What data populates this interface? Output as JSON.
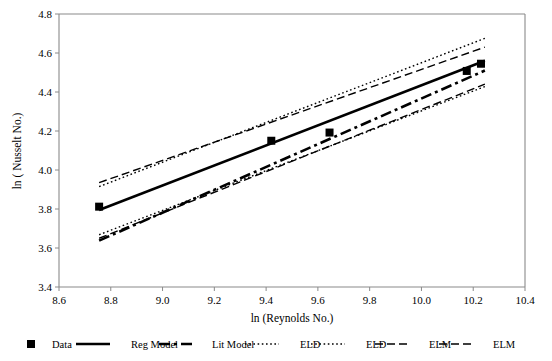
{
  "chart_data": {
    "type": "line",
    "title": "",
    "xlabel": "ln (Reynolds No.)",
    "ylabel": "ln ( Nusselt No.)",
    "xlim": [
      8.6,
      10.4
    ],
    "ylim": [
      3.4,
      4.8
    ],
    "xticks": [
      "8.6",
      "8.8",
      "9.0",
      "9.2",
      "9.4",
      "9.6",
      "9.8",
      "10.0",
      "10.2",
      "10.4"
    ],
    "yticks": [
      "3.4",
      "3.6",
      "3.8",
      "4.0",
      "4.2",
      "4.4",
      "4.6",
      "4.8"
    ],
    "grid": false,
    "legend_position": "bottom",
    "series": [
      {
        "name": "Data",
        "style": "marker",
        "marker": "square",
        "points": [
          {
            "x": 8.755,
            "y": 3.812
          },
          {
            "x": 9.42,
            "y": 4.15
          },
          {
            "x": 9.645,
            "y": 4.192
          },
          {
            "x": 10.175,
            "y": 4.508
          },
          {
            "x": 10.23,
            "y": 4.545
          }
        ]
      },
      {
        "name": "Reg Model",
        "style": "solid-thick",
        "points": [
          {
            "x": 8.755,
            "y": 3.795
          },
          {
            "x": 10.245,
            "y": 4.56
          }
        ]
      },
      {
        "name": "Lit Model",
        "style": "dash-dot-thick",
        "points": [
          {
            "x": 8.755,
            "y": 3.638
          },
          {
            "x": 10.245,
            "y": 4.51
          }
        ]
      },
      {
        "name": "ELD",
        "style": "dotted",
        "points": [
          {
            "x": 8.755,
            "y": 3.915
          },
          {
            "x": 10.245,
            "y": 4.675
          }
        ]
      },
      {
        "name": "ELD",
        "style": "dotted",
        "points": [
          {
            "x": 8.755,
            "y": 3.668
          },
          {
            "x": 10.245,
            "y": 4.428
          }
        ]
      },
      {
        "name": "ELM",
        "style": "dashed",
        "points": [
          {
            "x": 8.755,
            "y": 3.935
          },
          {
            "x": 10.245,
            "y": 4.63
          }
        ]
      },
      {
        "name": "ELM",
        "style": "dashed",
        "points": [
          {
            "x": 8.755,
            "y": 3.65
          },
          {
            "x": 10.245,
            "y": 4.44
          }
        ]
      }
    ],
    "legend": [
      {
        "label": "Data",
        "style": "marker"
      },
      {
        "label": "Reg Model",
        "style": "solid-thick"
      },
      {
        "label": "Lit Model",
        "style": "dash-dot-thick"
      },
      {
        "label": "ELD",
        "style": "dotted"
      },
      {
        "label": "ELD",
        "style": "dotted"
      },
      {
        "label": "ELM",
        "style": "dashed"
      },
      {
        "label": "ELM",
        "style": "dashed"
      }
    ],
    "colors": {
      "series": "#000000",
      "axis": "#8a8a8a",
      "background": "#ffffff"
    }
  }
}
